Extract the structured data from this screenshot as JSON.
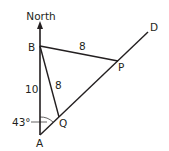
{
  "diagram": {
    "type": "geometry-bearing",
    "labels": {
      "north": "North",
      "point_a": "A",
      "point_b": "B",
      "point_p": "P",
      "point_q": "Q",
      "point_d": "D",
      "length_ab": "10",
      "length_bp": "8",
      "length_bq": "8",
      "angle_a": "43°"
    },
    "points": {
      "A": [
        40,
        135
      ],
      "B": [
        40,
        46
      ],
      "P": [
        118,
        61
      ],
      "Q": [
        59,
        117
      ],
      "D_end": [
        148,
        32
      ],
      "north_tip": [
        40,
        23
      ]
    },
    "colors": {
      "line": "#231f20",
      "background": "#ffffff"
    }
  }
}
